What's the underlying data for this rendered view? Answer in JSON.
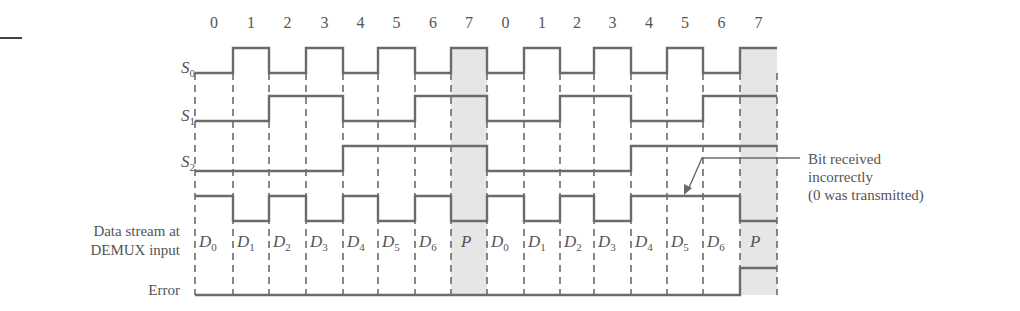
{
  "top_rule": {
    "x1": 0,
    "x2": 22,
    "y": 38
  },
  "boundaries": [
    195,
    233,
    269,
    306,
    343,
    378,
    415,
    451,
    487,
    524,
    560,
    594,
    631,
    667,
    703,
    740,
    777
  ],
  "slot_numbers": [
    "0",
    "1",
    "2",
    "3",
    "4",
    "5",
    "6",
    "7",
    "0",
    "1",
    "2",
    "3",
    "4",
    "5",
    "6",
    "7"
  ],
  "signals": [
    {
      "id": "S0",
      "label_base": "S",
      "label_sub": "0",
      "high_y": 48,
      "low_y": 73,
      "label_y": 58,
      "bits": [
        0,
        1,
        0,
        1,
        0,
        1,
        0,
        1,
        0,
        1,
        0,
        1,
        0,
        1,
        0,
        1
      ]
    },
    {
      "id": "S1",
      "label_base": "S",
      "label_sub": "1",
      "high_y": 96,
      "low_y": 121,
      "label_y": 106,
      "bits": [
        0,
        0,
        1,
        1,
        0,
        0,
        1,
        1,
        0,
        0,
        1,
        1,
        0,
        0,
        1,
        1
      ]
    },
    {
      "id": "S2",
      "label_base": "S",
      "label_sub": "2",
      "high_y": 146,
      "low_y": 171,
      "label_y": 150,
      "bits": [
        0,
        0,
        0,
        0,
        1,
        1,
        1,
        1,
        0,
        0,
        0,
        0,
        1,
        1,
        1,
        1
      ]
    },
    {
      "id": "DATA",
      "high_y": 196,
      "low_y": 221,
      "bits": [
        1,
        0,
        1,
        0,
        1,
        0,
        1,
        0,
        1,
        0,
        1,
        0,
        1,
        1,
        1,
        0
      ]
    },
    {
      "id": "ERROR",
      "high_y": 268,
      "low_y": 295,
      "bits": [
        0,
        0,
        0,
        0,
        0,
        0,
        0,
        0,
        0,
        0,
        0,
        0,
        0,
        0,
        0,
        1
      ]
    }
  ],
  "labels": {
    "data_stream_line1": "Data stream at",
    "data_stream_line2": "DEMUX input",
    "error": "Error"
  },
  "data_slot_labels": [
    {
      "base": "D",
      "sub": "0"
    },
    {
      "base": "D",
      "sub": "1"
    },
    {
      "base": "D",
      "sub": "2"
    },
    {
      "base": "D",
      "sub": "3"
    },
    {
      "base": "D",
      "sub": "4"
    },
    {
      "base": "D",
      "sub": "5"
    },
    {
      "base": "D",
      "sub": "6"
    },
    {
      "base": "P",
      "sub": ""
    },
    {
      "base": "D",
      "sub": "0"
    },
    {
      "base": "D",
      "sub": "1"
    },
    {
      "base": "D",
      "sub": "2"
    },
    {
      "base": "D",
      "sub": "3"
    },
    {
      "base": "D",
      "sub": "4"
    },
    {
      "base": "D",
      "sub": "5"
    },
    {
      "base": "D",
      "sub": "6"
    },
    {
      "base": "P",
      "sub": ""
    }
  ],
  "shaded_slots": [
    7,
    15
  ],
  "annotation": {
    "line1": "Bit received",
    "line2": "incorrectly",
    "line3": "(0 was transmitted)"
  },
  "colors": {
    "line": "#6b6b6b",
    "shade": "#e6e6e6",
    "text": "#555555"
  }
}
